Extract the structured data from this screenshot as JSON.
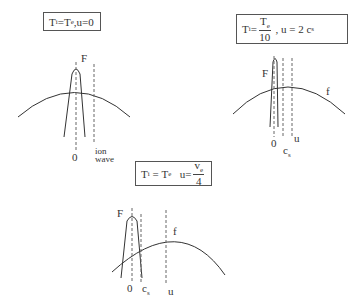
{
  "panels": [
    {
      "id": "panel-1",
      "caption": {
        "t_i": "T",
        "t_i_sub": "i",
        "eq": "=",
        "t_e": "T",
        "t_e_sub": "e",
        "rest": " ,u=0"
      },
      "labels": {
        "F": "F",
        "zero": "0",
        "ion": "ion",
        "wave": "wave"
      }
    },
    {
      "id": "panel-2",
      "caption": {
        "t_i": "T",
        "t_i_sub": "i",
        "eq": " = ",
        "num": "T",
        "num_sub": "e",
        "den": "10",
        "rest": " , u = 2 c",
        "rest_sub": "s"
      },
      "labels": {
        "F": "F",
        "f": "f",
        "zero": "0",
        "cs": "c",
        "cs_sub": "s",
        "u": "u"
      }
    },
    {
      "id": "panel-3",
      "caption": {
        "t_i": "T",
        "t_i_sub": "i",
        "eq": " = ",
        "t_e": "T",
        "t_e_sub": "e",
        "u": "u=",
        "num": "v",
        "num_sub": "e",
        "den": "4"
      },
      "labels": {
        "F": "F",
        "f": "f",
        "zero": "0",
        "cs": "c",
        "cs_sub": "s",
        "u": "u"
      }
    }
  ]
}
